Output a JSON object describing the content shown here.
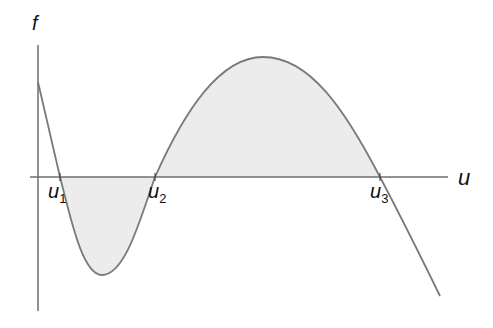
{
  "diagram": {
    "axes": {
      "x_label": "u",
      "y_label": "f"
    },
    "roots": [
      {
        "name": "u",
        "sub": "1"
      },
      {
        "name": "u",
        "sub": "2"
      },
      {
        "name": "u",
        "sub": "3"
      }
    ],
    "colors": {
      "axis": "#6e6e6e",
      "curve": "#7a7a7a",
      "fill": "#ececec"
    }
  }
}
